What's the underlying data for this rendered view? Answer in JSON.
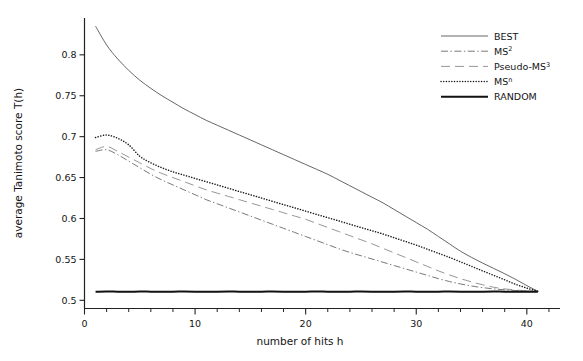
{
  "chart_data": {
    "type": "line",
    "title": "",
    "xlabel": "number of hits h",
    "ylabel": "average Tanimoto score T(h)",
    "xlim": [
      0,
      43
    ],
    "ylim": [
      0.49,
      0.845
    ],
    "xticks": [
      0,
      10,
      20,
      30,
      40
    ],
    "xtick_labels": [
      "0",
      "10",
      "20",
      "30",
      "40"
    ],
    "yticks": [
      0.5,
      0.55,
      0.6,
      0.65,
      0.7,
      0.75,
      0.8
    ],
    "ytick_labels": [
      "0.5",
      "0.55",
      "0.6",
      "0.65",
      "0.7",
      "0.75",
      "0.8"
    ],
    "xminor_step": 2,
    "grid": false,
    "legend_position": "top-right",
    "x": [
      1,
      2,
      3,
      4,
      5,
      6,
      7,
      8,
      9,
      10,
      11,
      12,
      13,
      14,
      15,
      16,
      17,
      18,
      19,
      20,
      21,
      22,
      23,
      24,
      25,
      26,
      27,
      28,
      29,
      30,
      31,
      32,
      33,
      34,
      35,
      36,
      37,
      38,
      39,
      40,
      41
    ],
    "series": [
      {
        "name": "BEST",
        "style": "solid-thin",
        "color": "#555555",
        "width": 0.9,
        "values": [
          0.835,
          0.812,
          0.795,
          0.781,
          0.769,
          0.759,
          0.75,
          0.742,
          0.734,
          0.727,
          0.72,
          0.714,
          0.708,
          0.702,
          0.696,
          0.69,
          0.684,
          0.678,
          0.672,
          0.666,
          0.66,
          0.654,
          0.647,
          0.64,
          0.633,
          0.626,
          0.619,
          0.611,
          0.603,
          0.595,
          0.587,
          0.578,
          0.569,
          0.56,
          0.5525,
          0.5455,
          0.539,
          0.5325,
          0.5255,
          0.518,
          0.511
        ]
      },
      {
        "name": "MS2",
        "label_base": "MS",
        "label_sup": "2",
        "style": "dash-dot",
        "color": "#6a6a6a",
        "width": 0.9,
        "values": [
          0.682,
          0.684,
          0.678,
          0.67,
          0.662,
          0.654,
          0.647,
          0.641,
          0.635,
          0.629,
          0.623,
          0.618,
          0.613,
          0.608,
          0.603,
          0.598,
          0.593,
          0.588,
          0.583,
          0.578,
          0.573,
          0.568,
          0.563,
          0.5585,
          0.5545,
          0.5505,
          0.5465,
          0.5425,
          0.5385,
          0.5345,
          0.5305,
          0.5265,
          0.523,
          0.52,
          0.5175,
          0.5155,
          0.514,
          0.5128,
          0.512,
          0.5114,
          0.511
        ]
      },
      {
        "name": "Pseudo-MS3",
        "label_base": "Pseudo-MS",
        "label_sup": "3",
        "style": "long-dash",
        "color": "#8a8a8a",
        "width": 0.9,
        "values": [
          0.684,
          0.688,
          0.682,
          0.675,
          0.668,
          0.661,
          0.655,
          0.65,
          0.645,
          0.64,
          0.635,
          0.631,
          0.627,
          0.623,
          0.619,
          0.615,
          0.611,
          0.607,
          0.603,
          0.599,
          0.594,
          0.589,
          0.584,
          0.579,
          0.574,
          0.569,
          0.5635,
          0.558,
          0.5525,
          0.547,
          0.5415,
          0.536,
          0.531,
          0.5265,
          0.5225,
          0.519,
          0.516,
          0.514,
          0.5126,
          0.5116,
          0.511
        ]
      },
      {
        "name": "MSn",
        "label_base": "MS",
        "label_sup": "n",
        "style": "dotted",
        "color": "#1c1c1c",
        "width": 1.5,
        "values": [
          0.699,
          0.702,
          0.698,
          0.69,
          0.676,
          0.668,
          0.662,
          0.657,
          0.653,
          0.649,
          0.645,
          0.641,
          0.637,
          0.633,
          0.629,
          0.625,
          0.621,
          0.617,
          0.613,
          0.609,
          0.605,
          0.601,
          0.597,
          0.593,
          0.589,
          0.585,
          0.581,
          0.5765,
          0.572,
          0.5675,
          0.5625,
          0.5575,
          0.5525,
          0.547,
          0.5415,
          0.536,
          0.5305,
          0.525,
          0.5195,
          0.515,
          0.511
        ]
      },
      {
        "name": "RANDOM",
        "style": "solid-thick",
        "color": "#111111",
        "width": 2.0,
        "values": [
          0.5105,
          0.5107,
          0.5106,
          0.5105,
          0.5107,
          0.5106,
          0.5105,
          0.5106,
          0.5107,
          0.5106,
          0.5105,
          0.5106,
          0.5107,
          0.5106,
          0.5105,
          0.5106,
          0.5107,
          0.5106,
          0.5105,
          0.5106,
          0.5107,
          0.5106,
          0.5105,
          0.5106,
          0.5107,
          0.5106,
          0.5105,
          0.5106,
          0.5107,
          0.5106,
          0.5105,
          0.5106,
          0.5107,
          0.5106,
          0.5105,
          0.5106,
          0.5107,
          0.5106,
          0.5105,
          0.5106,
          0.5105
        ]
      }
    ]
  },
  "legend": {
    "entries": [
      {
        "label": "BEST",
        "sup": ""
      },
      {
        "label": "MS",
        "sup": "2"
      },
      {
        "label": "Pseudo-MS",
        "sup": "3"
      },
      {
        "label": "MS",
        "sup": "n"
      },
      {
        "label": "RANDOM",
        "sup": ""
      }
    ]
  },
  "axes": {
    "x_title": "number of hits h",
    "y_title": "average Tanimoto score T(h)"
  }
}
